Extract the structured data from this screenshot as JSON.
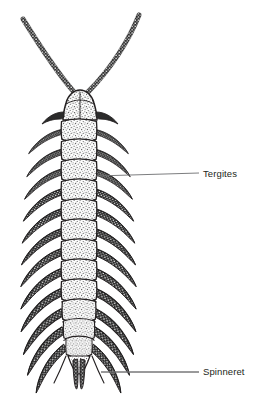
{
  "figure": {
    "name": "symphylan-dorsal-view",
    "background_color": "#ffffff",
    "ink_color": "#231f20",
    "leader_color": "#6d6e71"
  },
  "labels": [
    {
      "id": "tergites",
      "text": "Tergites",
      "x": 203,
      "y": 168,
      "leaders": [
        {
          "x1": 199,
          "y1": 173,
          "x2": 106,
          "y2": 141
        },
        {
          "x1": 199,
          "y1": 173,
          "x2": 96,
          "y2": 176
        }
      ]
    },
    {
      "id": "spinneret",
      "text": "Spinneret",
      "x": 203,
      "y": 366,
      "leaders": [
        {
          "x1": 199,
          "y1": 372,
          "x2": 101,
          "y2": 372
        }
      ]
    }
  ],
  "anatomy": {
    "antennae": {
      "count": 2,
      "style": "beaded-segmented-chain",
      "left_tip": {
        "x": 22,
        "y": 18
      },
      "right_tip": {
        "x": 140,
        "y": 14
      },
      "junction": {
        "x": 80,
        "y": 96
      }
    },
    "head": {
      "shape": "rounded-trapezoid",
      "texture": "stippled",
      "top": 92,
      "bottom": 122,
      "width": 30
    },
    "body_segments": 12,
    "tergite_style": "wavy-bordered-stippled-plates",
    "leg_pairs": 12,
    "leg_style": "tapered-backswept-hairy",
    "terminal_structure": "paired-spinnerets",
    "body_left": 61,
    "body_right": 96,
    "body_top": 118,
    "body_bottom": 360
  }
}
